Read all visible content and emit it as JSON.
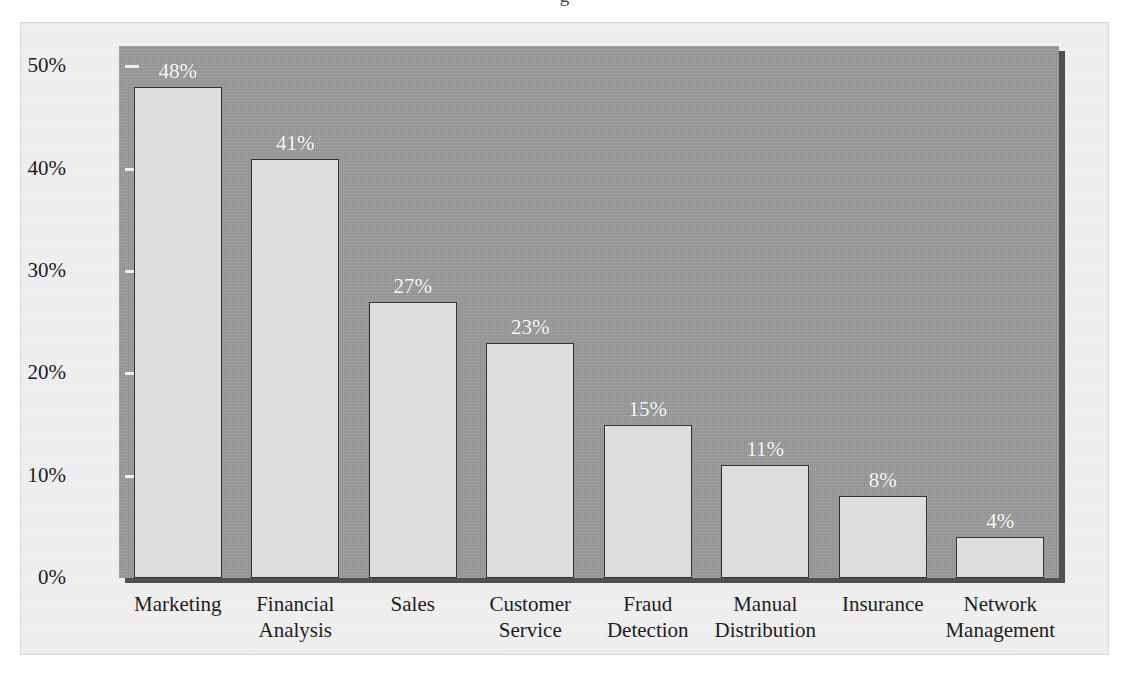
{
  "figure": {
    "title_remnant": "g",
    "background_color": "#f2f2f2",
    "plot_background_color": "#9a9a9a",
    "bar_fill_color": "#dededd",
    "bar_border_color": "#333333",
    "data_label_color": "#fbfbfb",
    "axis_text_color": "#1d1d1d"
  },
  "chart_data": {
    "type": "bar",
    "title": "",
    "xlabel": "",
    "ylabel": "",
    "ylim": [
      0,
      52
    ],
    "grid": false,
    "legend": "none",
    "ytick_labels": [
      "50%",
      "40%",
      "30%",
      "20%",
      "10%",
      "0%"
    ],
    "ytick_values": [
      50,
      40,
      30,
      20,
      10,
      0
    ],
    "categories": [
      "Marketing",
      "Financial Analysis",
      "Sales",
      "Customer Service",
      "Fraud Detection",
      "Manual Distribution",
      "Insurance",
      "Network Management"
    ],
    "category_lines": [
      [
        "Marketing",
        ""
      ],
      [
        "Financial",
        "Analysis"
      ],
      [
        "Sales",
        ""
      ],
      [
        "Customer",
        "Service"
      ],
      [
        "Fraud",
        "Detection"
      ],
      [
        "Manual",
        "Distribution"
      ],
      [
        "Insurance",
        ""
      ],
      [
        "Network",
        "Management"
      ]
    ],
    "values": [
      48,
      41,
      27,
      23,
      15,
      11,
      8,
      4
    ],
    "data_labels": [
      "48%",
      "41%",
      "27%",
      "23%",
      "15%",
      "11%",
      "8%",
      "4%"
    ]
  }
}
